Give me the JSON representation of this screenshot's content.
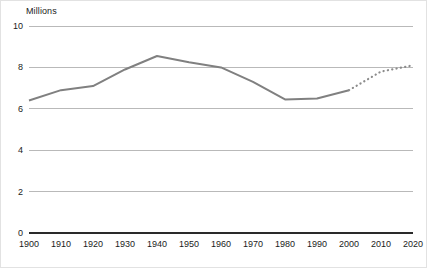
{
  "chart_data": {
    "type": "line",
    "title": "",
    "subtitle": "",
    "xlabel": "",
    "ylabel": "Millions",
    "axis_unit_label": "Millions",
    "categories": [
      1900,
      1910,
      1920,
      1930,
      1940,
      1950,
      1960,
      1970,
      1980,
      1990,
      2000,
      2010,
      2020
    ],
    "x": [
      1900,
      1910,
      1920,
      1930,
      1940,
      1950,
      1960,
      1970,
      1980,
      1990,
      2000,
      2010,
      2020
    ],
    "xtick_labels": [
      "1900",
      "1910",
      "1920",
      "1930",
      "1940",
      "1950",
      "1960",
      "1970",
      "1980",
      "1990",
      "2000",
      "2010",
      "2020"
    ],
    "ytick_labels": [
      "0",
      "2",
      "4",
      "6",
      "8",
      "10"
    ],
    "yticks": [
      0,
      2,
      4,
      6,
      8,
      10
    ],
    "ylim": [
      0,
      10
    ],
    "xlim": [
      1900,
      2020
    ],
    "grid": true,
    "grid_axis": "y",
    "legend": false,
    "legend_position": "none",
    "series": [
      {
        "name": "Observed",
        "style": "solid",
        "color": "#808080",
        "x": [
          1900,
          1910,
          1920,
          1930,
          1940,
          1950,
          1960,
          1970,
          1980,
          1990,
          2000
        ],
        "values": [
          6.4,
          6.9,
          7.1,
          7.9,
          8.55,
          8.25,
          8.0,
          7.3,
          6.45,
          6.5,
          6.9
        ]
      },
      {
        "name": "Projected",
        "style": "dotted",
        "color": "#8c8c8c",
        "x": [
          2000,
          2010,
          2020
        ],
        "values": [
          6.9,
          7.8,
          8.1
        ]
      }
    ],
    "annotations": []
  },
  "style": {
    "line_color": "#808080",
    "dotted_color": "#8c8c8c",
    "grid_color": "#b9b9b9",
    "baseline_color": "#2a2a2a",
    "text_color": "#1b1b1b",
    "background": "#ffffff",
    "border_color": "#e2e2e2"
  }
}
